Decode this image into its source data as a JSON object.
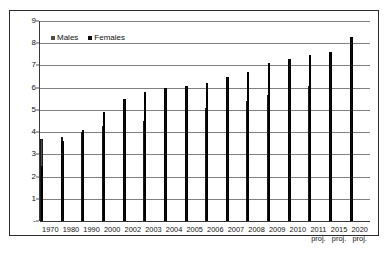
{
  "chart_data": {
    "type": "bar",
    "title": "",
    "subtitle": "",
    "xlabel": "",
    "ylabel": "",
    "ylim": [
      0,
      9
    ],
    "ytick_labels": [
      "-",
      "1",
      "2",
      "3",
      "4",
      "5",
      "6",
      "7",
      "8",
      "9"
    ],
    "ytick_values": [
      0,
      1,
      2,
      3,
      4,
      5,
      6,
      7,
      8,
      9
    ],
    "grid": true,
    "legend_position": "top-left",
    "categories": [
      "1970",
      "1980",
      "1990",
      "2000",
      "2002",
      "2003",
      "2004",
      "2005",
      "2006",
      "2007",
      "2008",
      "2009",
      "2010",
      "2011 proj.",
      "2015 proj.",
      "2020 proj."
    ],
    "category_labels": [
      {
        "main": "1970",
        "sub": ""
      },
      {
        "main": "1980",
        "sub": ""
      },
      {
        "main": "1990",
        "sub": ""
      },
      {
        "main": "2000",
        "sub": ""
      },
      {
        "main": "2002",
        "sub": ""
      },
      {
        "main": "2003",
        "sub": ""
      },
      {
        "main": "2004",
        "sub": ""
      },
      {
        "main": "2005",
        "sub": ""
      },
      {
        "main": "2006",
        "sub": ""
      },
      {
        "main": "2007",
        "sub": ""
      },
      {
        "main": "2008",
        "sub": ""
      },
      {
        "main": "2009",
        "sub": ""
      },
      {
        "main": "2010",
        "sub": ""
      },
      {
        "main": "2011",
        "sub": "proj."
      },
      {
        "main": "2015",
        "sub": "proj."
      },
      {
        "main": "2020",
        "sub": "proj."
      }
    ],
    "series": [
      {
        "name": "Males",
        "color": "#4d4d4d",
        "values": [
          3.6,
          3.7,
          3.9,
          4.2,
          4.3,
          4.4,
          4.6,
          4.9,
          5.0,
          5.1,
          5.3,
          5.6,
          5.8,
          6.0,
          6.0,
          6.4
        ]
      },
      {
        "name": "Females",
        "color": "#0d0d0d",
        "values": [
          2.4,
          3.5,
          4.0,
          4.8,
          5.4,
          5.7,
          5.9,
          6.0,
          6.1,
          6.4,
          6.6,
          7.0,
          7.2,
          7.4,
          7.5,
          8.2
        ]
      }
    ]
  },
  "legend": {
    "items": [
      {
        "label": "Males",
        "swatch": "males-swatch"
      },
      {
        "label": "Females",
        "swatch": "females-swatch"
      }
    ]
  }
}
